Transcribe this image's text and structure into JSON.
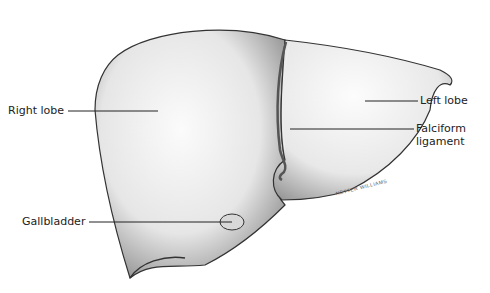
{
  "diagram": {
    "labels": {
      "right_lobe": "Right lobe",
      "left_lobe": "Left lobe",
      "falciform_line1": "Falciform",
      "falciform_line2": "ligament",
      "gallbladder": "Gallbladder"
    },
    "signature": "NETTER WILLIAMS"
  }
}
